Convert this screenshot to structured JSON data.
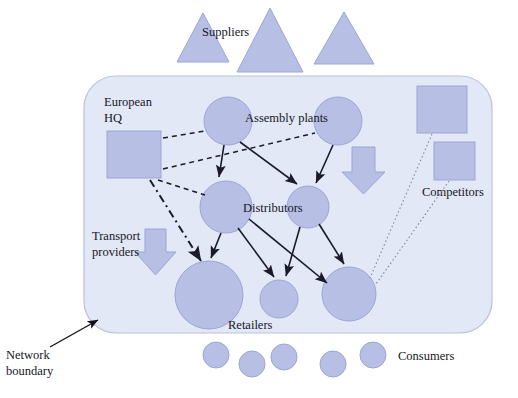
{
  "diagram": {
    "labels": {
      "suppliers": "Suppliers",
      "european_hq_line1": "European",
      "european_hq_line2": "HQ",
      "assembly_plants": "Assembly plants",
      "distributors": "Distributors",
      "retailers": "Retailers",
      "consumers": "Consumers",
      "competitors": "Competitors",
      "transport_line1": "Transport",
      "transport_line2": "providers",
      "network_line1": "Network",
      "network_line2": "boundary"
    },
    "colors": {
      "node_fill": "#b7c0e4",
      "node_stroke": "#9aa6d6",
      "boundary_fill": "#e3e8f6",
      "boundary_stroke": "#b9c2de",
      "arrow_stroke": "#1a1a28",
      "dotted_stroke": "#7a86ab",
      "text": "#16161f",
      "page_background": "#ffffff"
    },
    "counts": {
      "suppliers": 3,
      "assembly_plants": 2,
      "distributors": 2,
      "retailers": 3,
      "consumers": 5,
      "competitors": 2,
      "transport_arrows": 2,
      "european_hq": 1
    },
    "link_styles": {
      "material_flow": "solid-arrow",
      "hq_control": "dashed",
      "hq_direct": "dash-dot",
      "competitor_influence": "dotted"
    }
  }
}
